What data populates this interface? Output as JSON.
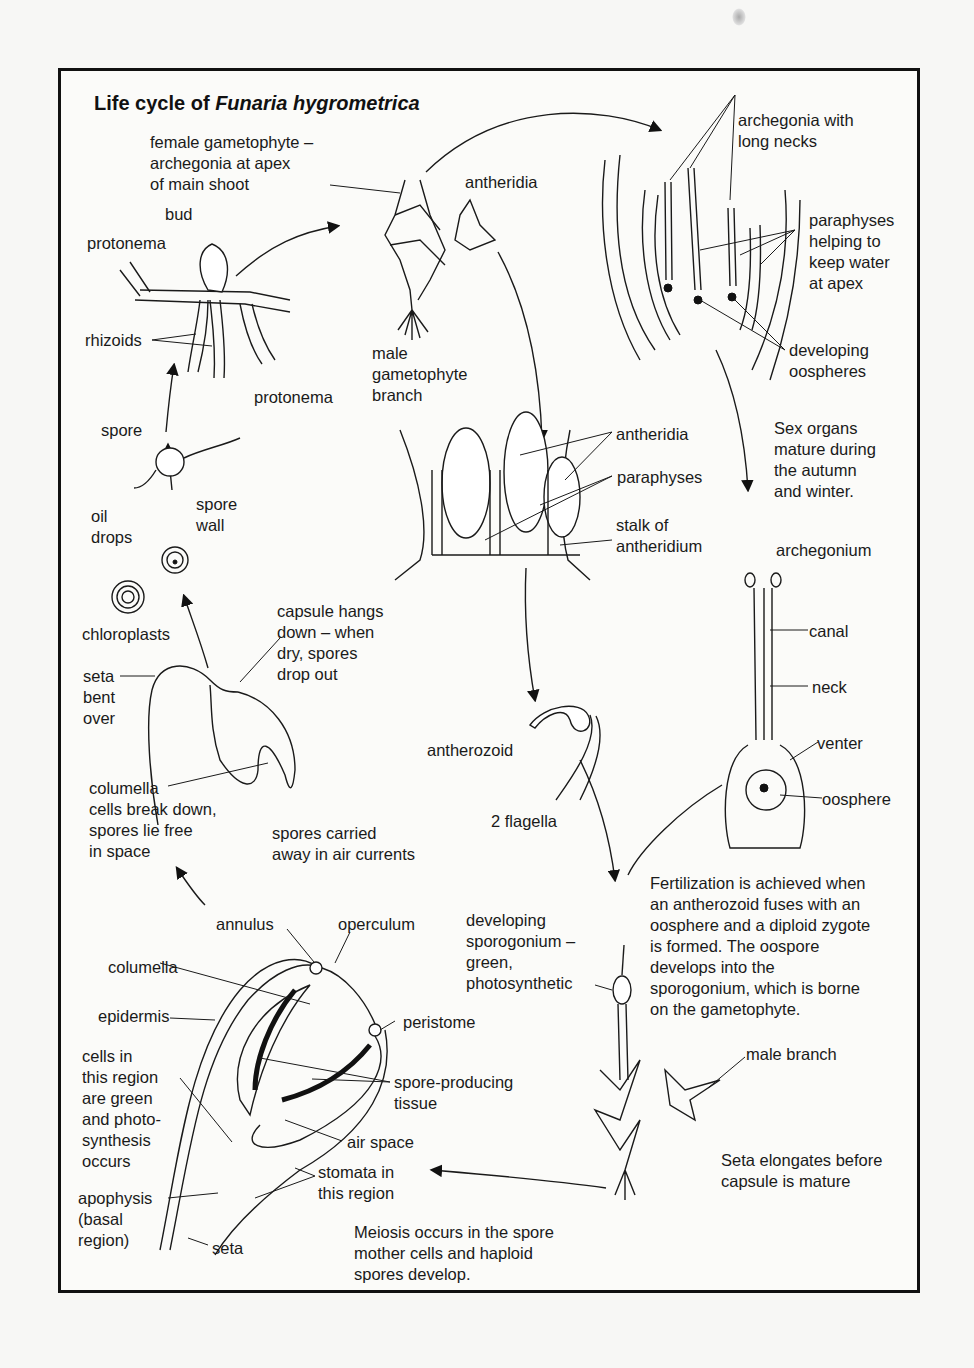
{
  "title": {
    "prefix": "Life cycle of ",
    "italic": "Funaria hygrometrica"
  },
  "labels": {
    "female_gametophyte": "female gametophyte –\narchegonia at apex\nof main shoot",
    "antheridia_top": "antheridia",
    "male_gametophyte_branch": "male\ngametophyte\nbranch",
    "bud": "bud",
    "protonema_top": "protonema",
    "rhizoids": "rhizoids",
    "protonema_mid": "protonema",
    "spore": "spore",
    "spore_wall": "spore\nwall",
    "oil_drops": "oil\ndrops",
    "chloroplasts": "chloroplasts",
    "archegonia_long_necks": "archegonia with\nlong necks",
    "paraphyses_water": "paraphyses\nhelping to\nkeep water\nat apex",
    "developing_oospheres": "developing\noospheres",
    "sex_organs": "Sex organs\nmature during\nthe autumn\nand winter.",
    "antheridia_mid": "antheridia",
    "paraphyses_mid": "paraphyses",
    "stalk_antheridium": "stalk of\nantheridium",
    "archegonium": "archegonium",
    "canal": "canal",
    "neck": "neck",
    "venter": "venter",
    "oosphere": "oosphere",
    "antherozoid": "antherozoid",
    "two_flagella": "2 flagella",
    "capsule_hangs": "capsule hangs\ndown – when\ndry, spores\ndrop out",
    "seta_bent": "seta\nbent\nover",
    "columella_break": "columella\ncells break down,\nspores lie free\nin space",
    "spores_carried": "spores carried\naway in air currents",
    "fertilization": "Fertilization is achieved when\nan antherozoid fuses with an\noosphere and a diploid zygote\nis formed. The oospore\ndevelops into the\nsporogonium, which is borne\non the gametophyte.",
    "developing_sporogonium": "developing\nsporogonium –\ngreen,\nphotosynthetic",
    "male_branch": "male branch",
    "seta_elongates": "Seta elongates before\ncapsule is mature",
    "annulus": "annulus",
    "operculum": "operculum",
    "columella": "columella",
    "epidermis": "epidermis",
    "peristome": "peristome",
    "cells_region": "cells in\nthis region\nare green\nand photo-\nsynthesis\noccurs",
    "spore_producing": "spore-producing\ntissue",
    "air_space": "air space",
    "stomata": "stomata in\nthis region",
    "apophysis": "apophysis\n(basal\nregion)",
    "seta": "seta",
    "meiosis": "Meiosis occurs in the spore\nmother cells and haploid\nspores develop."
  }
}
